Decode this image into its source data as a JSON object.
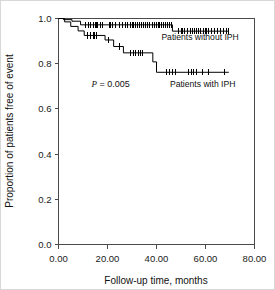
{
  "chart_data": {
    "type": "line",
    "title": "",
    "xlabel": "Follow-up time, months",
    "ylabel": "Proportion of patients free of event",
    "xlim": [
      0,
      80
    ],
    "ylim": [
      0.0,
      1.0
    ],
    "xticks": [
      "0.00",
      "20.00",
      "40.00",
      "60.00",
      "80.00"
    ],
    "xtick_values": [
      0,
      20,
      40,
      60,
      80
    ],
    "yticks": [
      "0.0",
      "0.2",
      "0.4",
      "0.6",
      "0.8",
      "1.0"
    ],
    "ytick_values": [
      0.0,
      0.2,
      0.4,
      0.6,
      0.8,
      1.0
    ],
    "grid": false,
    "legend_position": "inline-right",
    "annotations": [
      {
        "name": "p-value",
        "italic_part": "P",
        "rest_part": " = 0.005",
        "text": "P = 0.005",
        "x": 13.5,
        "y": 0.695
      }
    ],
    "series": [
      {
        "name": "Patients without IPH",
        "label": "Patients without IPH",
        "label_x": 42.0,
        "label_y": 0.905,
        "color": "#000000",
        "steps": [
          [
            0.0,
            1.0
          ],
          [
            2.0,
            1.0
          ],
          [
            2.0,
            0.995
          ],
          [
            5.5,
            0.995
          ],
          [
            5.5,
            0.988
          ],
          [
            9.0,
            0.988
          ],
          [
            9.0,
            0.972
          ],
          [
            46.5,
            0.972
          ],
          [
            46.5,
            0.944
          ],
          [
            69.5,
            0.944
          ]
        ],
        "censor_times": [
          11.0,
          12.2,
          13.0,
          14.4,
          15.3,
          16.1,
          17.2,
          18.0,
          21.0,
          22.1,
          23.4,
          24.8,
          26.0,
          27.3,
          28.2,
          29.4,
          30.4,
          31.3,
          32.2,
          33.0,
          33.9,
          34.8,
          35.6,
          36.4,
          37.3,
          38.2,
          39.0,
          40.1,
          41.0,
          41.9,
          42.8,
          43.6,
          44.5,
          45.4,
          46.2,
          49.0,
          50.4,
          51.5,
          52.6,
          53.8,
          54.6,
          55.5,
          56.4,
          57.2,
          58.1,
          59.0,
          60.2,
          61.4,
          62.5,
          63.6,
          64.8,
          66.0,
          67.2,
          68.4,
          69.4
        ]
      },
      {
        "name": "Patients with IPH",
        "label": "Patients with IPH",
        "label_x": 45.5,
        "label_y": 0.695,
        "color": "#000000",
        "steps": [
          [
            0.0,
            1.0
          ],
          [
            2.5,
            1.0
          ],
          [
            2.5,
            0.985
          ],
          [
            5.0,
            0.985
          ],
          [
            5.0,
            0.965
          ],
          [
            8.0,
            0.965
          ],
          [
            8.0,
            0.945
          ],
          [
            10.5,
            0.945
          ],
          [
            10.5,
            0.925
          ],
          [
            19.0,
            0.925
          ],
          [
            19.0,
            0.905
          ],
          [
            22.5,
            0.905
          ],
          [
            22.5,
            0.876
          ],
          [
            26.5,
            0.876
          ],
          [
            26.5,
            0.848
          ],
          [
            38.5,
            0.848
          ],
          [
            38.5,
            0.808
          ],
          [
            40.0,
            0.808
          ],
          [
            40.0,
            0.762
          ],
          [
            69.5,
            0.762
          ]
        ],
        "censor_times": [
          12.0,
          13.2,
          14.5,
          15.6,
          20.4,
          24.8,
          29.5,
          30.5,
          31.6,
          32.6,
          33.4,
          34.3,
          44.0,
          45.2,
          46.4,
          47.6,
          53.0,
          54.2,
          55.2,
          56.4,
          58.8,
          61.4,
          67.8
        ]
      }
    ]
  }
}
